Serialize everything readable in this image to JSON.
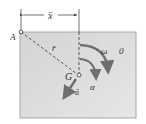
{
  "diagram": {
    "type": "rigid-body-kinematics",
    "labels": {
      "x_bar": "x̄",
      "point_A": "A",
      "r_bar": "r̄",
      "center_G": "G",
      "omega": "ω",
      "zero": "0",
      "alpha": "α",
      "a_bar": "ā"
    },
    "colors": {
      "body_fill": "#dcdcdc",
      "body_border": "#a8a8a8",
      "arrow": "#6e6e6e",
      "line": "#333333",
      "text": "#333333"
    }
  }
}
